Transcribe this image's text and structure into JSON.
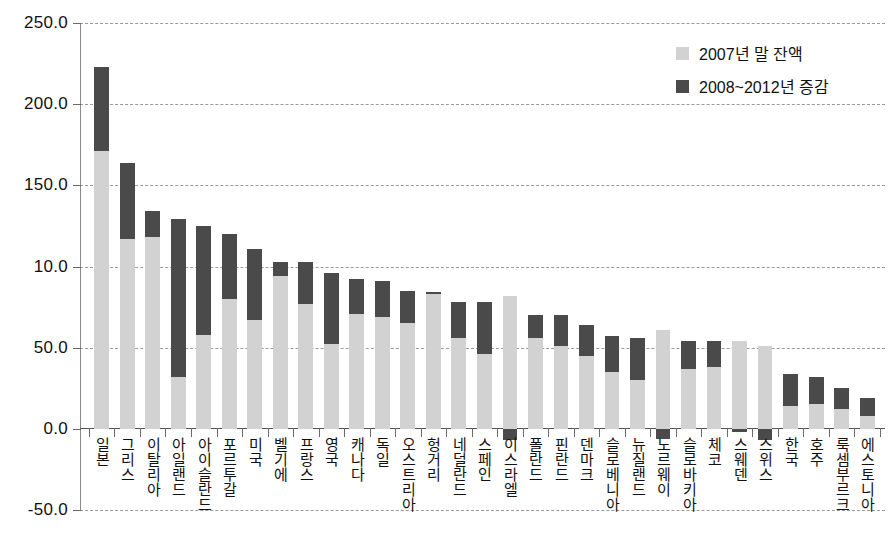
{
  "chart_data": {
    "type": "bar",
    "title": "",
    "subtitle": "",
    "xlabel": "",
    "ylabel": "",
    "stacked": true,
    "grid": true,
    "legend_position": "top-right",
    "ylim": [
      -50.0,
      250.0
    ],
    "yticks": [
      250.0,
      200.0,
      150.0,
      10.0,
      50.0,
      0.0,
      -50.0
    ],
    "ytick_labels": [
      "250.0",
      "200.0",
      "150.0",
      "10.0",
      "50.0",
      "0.0",
      "-50.0"
    ],
    "ytick_values": [
      250,
      200,
      150,
      100,
      50,
      0,
      -50
    ],
    "categories": [
      "일본",
      "그리스",
      "이탈리아",
      "아일랜드",
      "아이슬란드",
      "포르투갈",
      "미국",
      "벨기에",
      "프랑스",
      "영국",
      "캐나다",
      "독일",
      "오스트리아",
      "헝거리",
      "네덜란드",
      "스페인",
      "이스라엘",
      "폴란드",
      "핀란드",
      "덴마크",
      "슬로베니아",
      "뉴질랜드",
      "노르웨이",
      "슬로바키아",
      "체코",
      "스웨덴",
      "스위스",
      "한국",
      "호주",
      "룩셈부르크",
      "에스토니아"
    ],
    "series": [
      {
        "name": "2007년 말 잔액",
        "color": "#d2d2d2",
        "values": [
          171.0,
          117.0,
          118.0,
          32.0,
          58.0,
          80.0,
          67.0,
          94.0,
          77.0,
          52.0,
          71.0,
          69.0,
          65.0,
          83.0,
          56.0,
          46.0,
          82.0,
          56.0,
          51.0,
          45.0,
          35.0,
          30.0,
          61.0,
          37.0,
          38.0,
          54.0,
          51.0,
          14.0,
          15.0,
          12.0,
          8.0
        ]
      },
      {
        "name": "2008~2012년 증감",
        "color": "#4a4a4a",
        "values": [
          52.0,
          47.0,
          16.0,
          97.0,
          67.0,
          40.0,
          44.0,
          9.0,
          26.0,
          44.0,
          21.0,
          22.0,
          20.0,
          1.0,
          22.0,
          32.0,
          -7.0,
          14.0,
          19.0,
          19.0,
          22.0,
          26.0,
          -6.0,
          17.0,
          16.0,
          -2.0,
          -7.0,
          20.0,
          17.0,
          13.0,
          11.0
        ]
      }
    ],
    "totals": [
      223.0,
      164.0,
      134.0,
      129.0,
      125.0,
      120.0,
      111.0,
      103.0,
      103.0,
      96.0,
      92.0,
      91.0,
      85.0,
      84.0,
      78.0,
      78.0,
      75.0,
      70.0,
      70.0,
      64.0,
      57.0,
      56.0,
      55.0,
      54.0,
      54.0,
      52.0,
      44.0,
      34.0,
      32.0,
      25.0,
      19.0
    ]
  },
  "legend": {
    "items": [
      {
        "label": "2007년 말 잔액",
        "swatch": "base"
      },
      {
        "label": "2008~2012년 증감",
        "swatch": "delta"
      }
    ]
  },
  "colors": {
    "base": "#d2d2d2",
    "delta": "#4a4a4a",
    "axis": "#555555",
    "grid": "#9a9a9a",
    "background": "#ffffff"
  }
}
